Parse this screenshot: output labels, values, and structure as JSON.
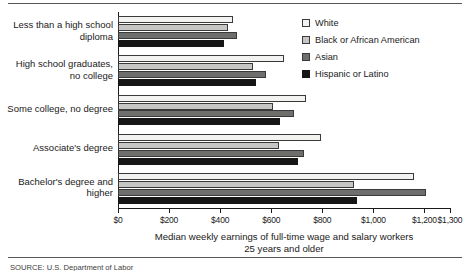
{
  "chart_data": {
    "type": "bar",
    "orientation": "horizontal",
    "title": "",
    "xlabel": "Median weekly earnings of full-time wage and salary workers 25 years and older",
    "ylabel": "",
    "xlim": [
      0,
      1300
    ],
    "grid": false,
    "legend_position": "top-right",
    "categories": [
      "Less than a high school diploma",
      "High school graduates, no college",
      "Some college, no degree",
      "Associate's degree",
      "Bachelor's degree and higher"
    ],
    "category_lines": [
      [
        "Less than a high school",
        "diploma"
      ],
      [
        "High school graduates,",
        "no college"
      ],
      [
        "Some college, no degree"
      ],
      [
        "Associate's degree"
      ],
      [
        "Bachelor's degree and",
        "higher"
      ]
    ],
    "series": [
      {
        "name": "White",
        "color": "#f2f2f0",
        "values": [
          450,
          650,
          735,
          795,
          1160
        ]
      },
      {
        "name": "Black or African American",
        "color": "#c6c6c4",
        "values": [
          430,
          530,
          605,
          630,
          925
        ]
      },
      {
        "name": "Asian",
        "color": "#6e6e6c",
        "values": [
          465,
          580,
          690,
          730,
          1205
        ]
      },
      {
        "name": "Hispanic or Latino",
        "color": "#161616",
        "values": [
          415,
          540,
          635,
          705,
          935
        ]
      }
    ],
    "xticks": [
      0,
      200,
      400,
      600,
      800,
      1000,
      1200,
      1300
    ],
    "xticklabels": [
      "$0",
      "$200",
      "$400",
      "$600",
      "$800",
      "$1,000",
      "$1,200",
      "$1,300"
    ]
  },
  "axis_title": {
    "line1": "Median weekly earnings of full-time wage and salary workers",
    "line2": "25 years and older"
  },
  "source": {
    "text": "SOURCE: U.S. Department of Labor"
  }
}
